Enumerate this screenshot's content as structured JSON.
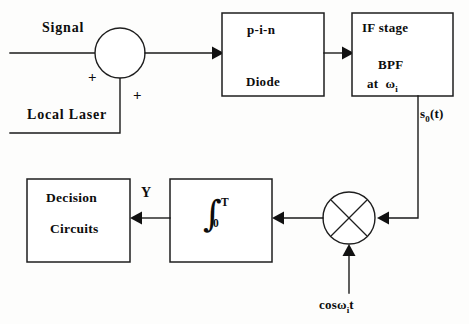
{
  "diagram": {
    "background_color": "#fdfdfc",
    "line_color": "#1a1a1a",
    "text_color": "#0d0d0d",
    "inputs": {
      "signal_label": "Signal",
      "local_laser_label": "Local Laser",
      "sum_sign_upper": "+",
      "sum_sign_lower": "+"
    },
    "blocks": [
      {
        "id": "photodiode",
        "line1": "p-i-n",
        "line2": "Diode",
        "x": 222,
        "y": 13,
        "w": 102,
        "h": 83
      },
      {
        "id": "if-stage",
        "line1": "IF stage",
        "line2": "BPF",
        "line3_prefix": "at",
        "line3_omega": "ω",
        "line3_subscript": "i",
        "x": 352,
        "y": 13,
        "w": 101,
        "h": 83
      },
      {
        "id": "integrator",
        "integral_glyph": "∫",
        "upper_limit": "T",
        "lower_limit": "0",
        "x": 170,
        "y": 179,
        "w": 102,
        "h": 83
      },
      {
        "id": "decision-circuits",
        "line1": "Decision",
        "line2": "Circuits",
        "x": 27,
        "y": 179,
        "w": 103,
        "h": 83
      }
    ],
    "nodes": [
      {
        "id": "summing-junction",
        "cx": 120,
        "cy": 53,
        "r": 25,
        "kind": "sum"
      },
      {
        "id": "mixer",
        "cx": 349,
        "cy": 218,
        "r": 26,
        "kind": "multiplier"
      }
    ],
    "signal_labels": {
      "if_output": "s₀(t)",
      "if_output_base": "s",
      "if_output_sub": "0",
      "if_output_tail": "(t)",
      "integrator_output": "Y",
      "local_oscillator_prefix": "cos",
      "local_oscillator_omega": "ω",
      "local_oscillator_sub": "i",
      "local_oscillator_tail": "t"
    }
  }
}
